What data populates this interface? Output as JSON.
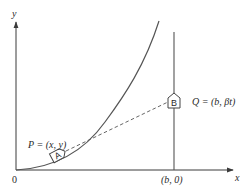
{
  "diagram": {
    "axes": {
      "x_label": "x",
      "y_label": "y",
      "origin_label": "0"
    },
    "points": {
      "P": {
        "marker": "A",
        "label": "P = (x, y)"
      },
      "Q": {
        "marker": "B",
        "label": "Q = (b, βt)"
      }
    },
    "tick_labels": {
      "b_point": "(b, 0)"
    },
    "colors": {
      "lines": "#555555",
      "text": "#2a2a2a",
      "background": "#ffffff"
    }
  }
}
